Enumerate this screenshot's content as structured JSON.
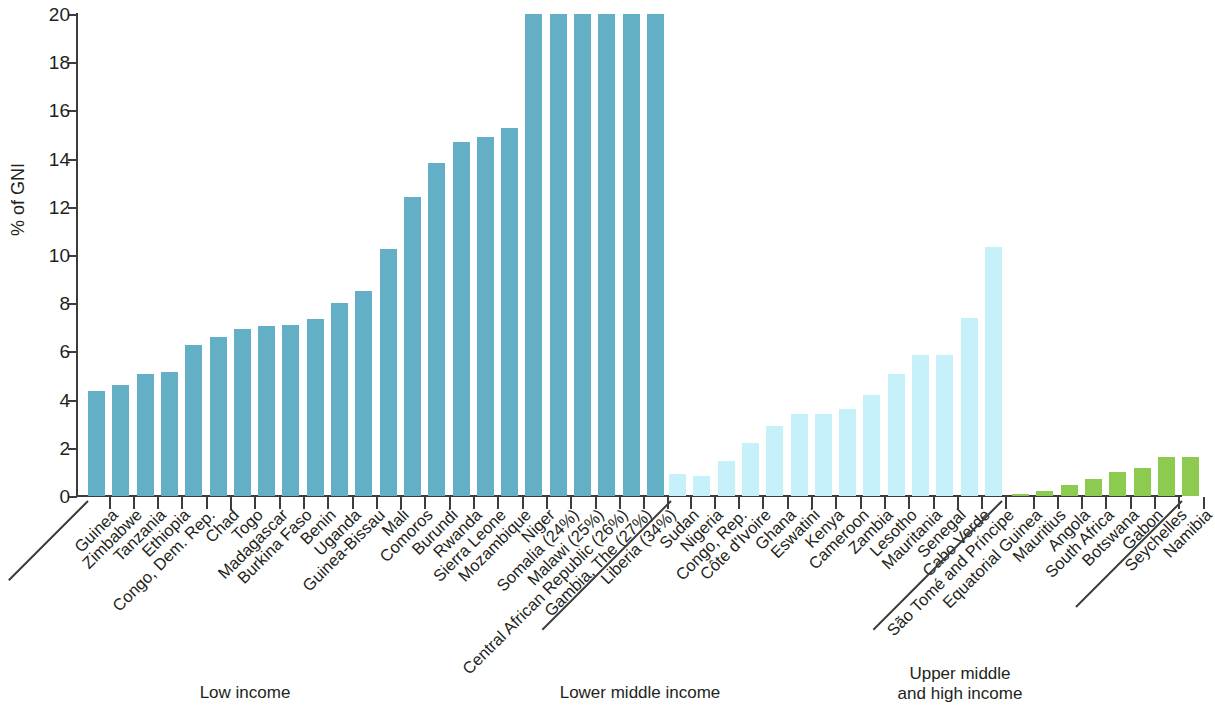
{
  "chart_data": {
    "type": "bar",
    "title": "",
    "xlabel": "",
    "ylabel": "% of GNI",
    "ylim": [
      0,
      20
    ],
    "yticks": [
      0,
      2,
      4,
      6,
      8,
      10,
      12,
      14,
      16,
      18,
      20
    ],
    "ytick_labels": [
      "0",
      "2",
      "4",
      "6",
      "8",
      "10",
      "12",
      "14",
      "16",
      "18",
      "20"
    ],
    "grid": false,
    "legend": "none",
    "note": "Five low-income bars exceed the 20% axis maximum and are clipped; their true values appear in parentheses in the category labels.",
    "categories": [
      "Guinea",
      "Zimbabwe",
      "Tanzania",
      "Ethiopia",
      "Congo, Dem. Rep.",
      "Chad",
      "Togo",
      "Madagascar",
      "Burkina Faso",
      "Benin",
      "Uganda",
      "Guinea-Bissau",
      "Mali",
      "Comoros",
      "Burundi",
      "Rwanda",
      "Sierra Leone",
      "Mozambique",
      "Niger",
      "Somalia (24%)",
      "Malawi (25%)",
      "Central African Republic (26%)",
      "Gambia, The (27%)",
      "Liberia (34%)",
      "Sudan",
      "Nigeria",
      "Congo, Rep.",
      "Côte d'Ivoire",
      "Ghana",
      "Eswatini",
      "Kenya",
      "Cameroon",
      "Zambia",
      "Lesotho",
      "Mauritania",
      "Senegal",
      "Cabo Verde",
      "São Tomé and Príncipe",
      "Equatorial Guinea",
      "Mauritius",
      "Angola",
      "South Africa",
      "Botswana",
      "Gabon",
      "Seychelles",
      "Namibia"
    ],
    "values": [
      4.35,
      4.6,
      5.05,
      5.15,
      6.25,
      6.6,
      6.95,
      7.05,
      7.1,
      7.35,
      8.0,
      8.5,
      10.25,
      12.4,
      13.8,
      14.7,
      14.9,
      15.25,
      20.0,
      20.0,
      20.0,
      20.0,
      20.0,
      20.0,
      0.9,
      0.85,
      1.45,
      2.2,
      2.9,
      3.4,
      3.4,
      3.6,
      4.2,
      5.05,
      5.85,
      5.85,
      7.4,
      10.35,
      0.1,
      0.2,
      0.45,
      0.7,
      1.0,
      1.15,
      1.6,
      1.6
    ],
    "clipped": [
      false,
      false,
      false,
      false,
      false,
      false,
      false,
      false,
      false,
      false,
      false,
      false,
      false,
      false,
      false,
      false,
      false,
      false,
      false,
      true,
      true,
      true,
      true,
      true,
      false,
      false,
      false,
      false,
      false,
      false,
      false,
      false,
      false,
      false,
      false,
      false,
      false,
      false,
      false,
      false,
      false,
      false,
      false,
      false,
      false,
      false
    ],
    "groups": [
      {
        "name": "Low income",
        "label": "Low income",
        "start": 0,
        "end": 23,
        "color": "#63b0c6",
        "class": "low"
      },
      {
        "name": "Lower middle income",
        "label": "Lower middle income",
        "start": 24,
        "end": 37,
        "color": "#c6f0fa",
        "class": "lowmid"
      },
      {
        "name": "Upper middle and high income",
        "label": "Upper middle\nand high income",
        "start": 38,
        "end": 45,
        "color": "#8ccb4f",
        "class": "upper"
      }
    ]
  },
  "colors": {
    "low_income": "#63b0c6",
    "lower_middle_income": "#c6f0fa",
    "upper_middle_high_income": "#8ccb4f",
    "axis": "#3c3c3b",
    "text": "#231f20",
    "background": "#ffffff"
  }
}
